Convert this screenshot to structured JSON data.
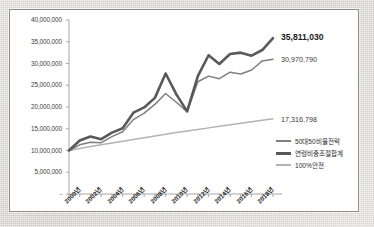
{
  "chart_data": {
    "type": "line",
    "title": "",
    "xlabel": "",
    "ylabel": "",
    "ylim": [
      0,
      40000000
    ],
    "grid": false,
    "legend_position": "right-bottom",
    "x": [
      "2000년",
      "2001년",
      "2002년",
      "2003년",
      "2004년",
      "2005년",
      "2006년",
      "2007년",
      "2008년",
      "2009년",
      "2010년",
      "2011년",
      "2012년",
      "2013년",
      "2014년",
      "2015년",
      "2016년",
      "2017년",
      "2018년",
      "2019년"
    ],
    "xtick_labels": [
      "2000년",
      "2002년",
      "2004년",
      "2006년",
      "2008년",
      "2010년",
      "2012년",
      "2014년",
      "2016년",
      "2018년"
    ],
    "ytick_labels": [
      "40,000,000",
      "35,000,000",
      "30,000,000",
      "25,000,000",
      "20,000,000",
      "15,000,000",
      "10,000,000",
      "5,000,000",
      "-"
    ],
    "ytick_values": [
      40000000,
      35000000,
      30000000,
      25000000,
      20000000,
      15000000,
      10000000,
      5000000,
      0
    ],
    "series": [
      {
        "name": "연령비중조절합계",
        "color": "#595959",
        "width": 2.6,
        "end_label": "35,811,030",
        "values": [
          10000000,
          12300000,
          13200000,
          12600000,
          14100000,
          15100000,
          18700000,
          19900000,
          22100000,
          27700000,
          22900000,
          19000000,
          27100000,
          31900000,
          29900000,
          32200000,
          32500000,
          31800000,
          33100000,
          35811030
        ]
      },
      {
        "name": "50대50비율전략",
        "color": "#7f7f7f",
        "width": 1.5,
        "end_label": "30,970,790",
        "values": [
          10000000,
          11300000,
          11900000,
          11800000,
          13200000,
          14300000,
          17100000,
          18600000,
          20600000,
          23100000,
          21100000,
          18900000,
          25800000,
          27100000,
          26500000,
          28000000,
          27600000,
          28500000,
          30600000,
          30970790
        ]
      },
      {
        "name": "100%안전",
        "color": "#b3b3b3",
        "width": 1.5,
        "end_label": "17,316,798",
        "values": [
          10000000,
          10450000,
          10900000,
          11300000,
          11750000,
          12150000,
          12550000,
          12950000,
          13350000,
          13750000,
          14150000,
          14500000,
          14850000,
          15200000,
          15550000,
          15900000,
          16250000,
          16600000,
          16950000,
          17316798
        ]
      }
    ],
    "legend": [
      {
        "label": "50대50비율전략",
        "color": "#7f7f7f",
        "width": 1.6
      },
      {
        "label": "연령비중조절합계",
        "color": "#595959",
        "width": 3.0
      },
      {
        "label": "100%안전",
        "color": "#b3b3b3",
        "width": 1.6
      }
    ]
  }
}
